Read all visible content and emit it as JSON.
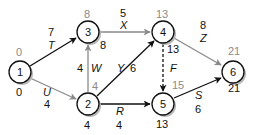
{
  "diagram": {
    "type": "activity-network",
    "nodes": [
      {
        "id": "1",
        "x": 20,
        "y": 72,
        "early": "0",
        "late": "0"
      },
      {
        "id": "2",
        "x": 88,
        "y": 104,
        "early": "4",
        "late": "4"
      },
      {
        "id": "3",
        "x": 88,
        "y": 32,
        "early": "8",
        "late": "8"
      },
      {
        "id": "4",
        "x": 163,
        "y": 32,
        "early": "13",
        "late": "13"
      },
      {
        "id": "5",
        "x": 163,
        "y": 104,
        "early": "15",
        "late": "13"
      },
      {
        "id": "6",
        "x": 233,
        "y": 72,
        "early": "21",
        "late": "21"
      }
    ],
    "edges": [
      {
        "from": "1",
        "to": "3",
        "activity": "T",
        "duration": "7",
        "style": "critical"
      },
      {
        "from": "1",
        "to": "2",
        "activity": "U",
        "duration": "4",
        "style": "noncritical"
      },
      {
        "from": "2",
        "to": "3",
        "activity": "W",
        "duration": "4",
        "style": "noncritical"
      },
      {
        "from": "3",
        "to": "4",
        "activity": "X",
        "duration": "5",
        "style": "noncritical"
      },
      {
        "from": "2",
        "to": "4",
        "activity": "Y",
        "duration": "6",
        "style": "critical"
      },
      {
        "from": "2",
        "to": "5",
        "activity": "R",
        "duration": "4",
        "style": "critical"
      },
      {
        "from": "4",
        "to": "5",
        "activity": "F",
        "duration": "",
        "style": "dummy"
      },
      {
        "from": "4",
        "to": "6",
        "activity": "Z",
        "duration": "8",
        "style": "noncritical"
      },
      {
        "from": "5",
        "to": "6",
        "activity": "S",
        "duration": "6",
        "style": "critical"
      }
    ],
    "colors": {
      "critical": "#111111",
      "noncritical": "#8a8a8a",
      "node_stroke": "#111111",
      "shadow": "#b0b0b0"
    }
  },
  "labels": {
    "n1_top": "0",
    "n1_bottom": "0",
    "n2_top": "4",
    "n2_bottom": "4",
    "n3_top": "8",
    "n3_right": "8",
    "n4_top": "13",
    "n4_right": "13",
    "n5_top": "15",
    "n5_bottom": "13",
    "n6_top": "21",
    "n6_bottom": "21",
    "n1": "1",
    "n2": "2",
    "n3": "3",
    "n4": "4",
    "n5": "5",
    "n6": "6",
    "T_act": "T",
    "T_dur": "7",
    "U_act": "U",
    "U_dur": "4",
    "W_act": "W",
    "W_dur": "4",
    "X_act": "X",
    "X_dur": "5",
    "Y_act": "Y",
    "Y_dur": "6",
    "R_act": "R",
    "R_dur": "4",
    "F_act": "F",
    "Z_act": "Z",
    "Z_dur": "8",
    "S_act": "S",
    "S_dur": "6"
  }
}
